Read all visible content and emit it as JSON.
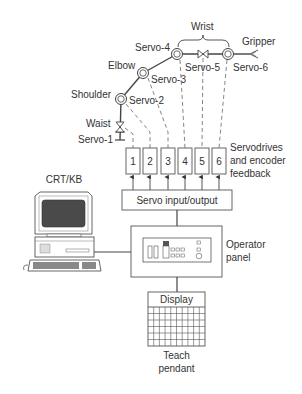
{
  "diagram": {
    "arm": {
      "wrist_label": "Wrist",
      "gripper_label": "Gripper",
      "joints": [
        {
          "name": "Waist",
          "servo": "Servo-1"
        },
        {
          "name": "Shoulder",
          "servo": "Servo-2"
        },
        {
          "name": "Elbow",
          "servo": "Servo-3"
        },
        {
          "name": "",
          "servo": "Servo-4"
        },
        {
          "name": "",
          "servo": "Servo-5"
        },
        {
          "name": "",
          "servo": "Servo-6"
        }
      ]
    },
    "servodrives": {
      "boxes": [
        "1",
        "2",
        "3",
        "4",
        "5",
        "6"
      ],
      "label_lines": [
        "Servodrives",
        "and encoder",
        "feedback"
      ]
    },
    "servo_io": {
      "label": "Servo input/output"
    },
    "computer": {
      "label": "CRT/KB"
    },
    "operator_panel": {
      "label_lines": [
        "Operator",
        "panel"
      ]
    },
    "teach_pendant": {
      "display_label": "Display",
      "label_lines": [
        "Teach",
        "pendant"
      ],
      "grid": {
        "columns": 10,
        "rows": 6
      }
    },
    "colors": {
      "line": "#444444",
      "text": "#333333",
      "screen": "#4a4a4a"
    }
  }
}
